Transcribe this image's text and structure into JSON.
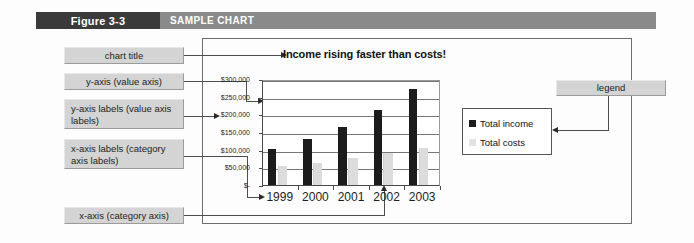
{
  "figure": {
    "number": "Figure 3-3",
    "title": "SAMPLE CHART"
  },
  "callouts": {
    "chart_title": "chart title",
    "y_axis": "y-axis (value axis)",
    "y_axis_labels": "y-axis labels (value axis labels)",
    "x_axis_labels": "x-axis labels (category axis labels)",
    "x_axis": "x-axis (category axis)",
    "legend": "legend"
  },
  "chart_data": {
    "type": "bar",
    "title": "Income rising faster than costs!",
    "xlabel": "",
    "ylabel": "",
    "categories": [
      "1999",
      "2000",
      "2001",
      "2002",
      "2003"
    ],
    "series": [
      {
        "name": "Total income",
        "color": "#1c1c1c",
        "values": [
          102000,
          130000,
          165000,
          213000,
          273000
        ]
      },
      {
        "name": "Total costs",
        "color": "#dcdcdc",
        "values": [
          55000,
          63000,
          76000,
          90000,
          105000
        ]
      }
    ],
    "ylim": [
      0,
      300000
    ],
    "ytick_labels": [
      "$300,000",
      "$250,000",
      "$200,000",
      "$150,000",
      "$100,000",
      "$50,000",
      "$-"
    ],
    "ytick_values": [
      300000,
      250000,
      200000,
      150000,
      100000,
      50000,
      0
    ],
    "grid": true,
    "legend_position": "right"
  },
  "colors": {
    "header_dark": "#3a3a3a",
    "header_gray": "#8a8a8a",
    "callout_fill": "#d4d4d4",
    "income": "#1c1c1c",
    "costs": "#dcdcdc"
  }
}
